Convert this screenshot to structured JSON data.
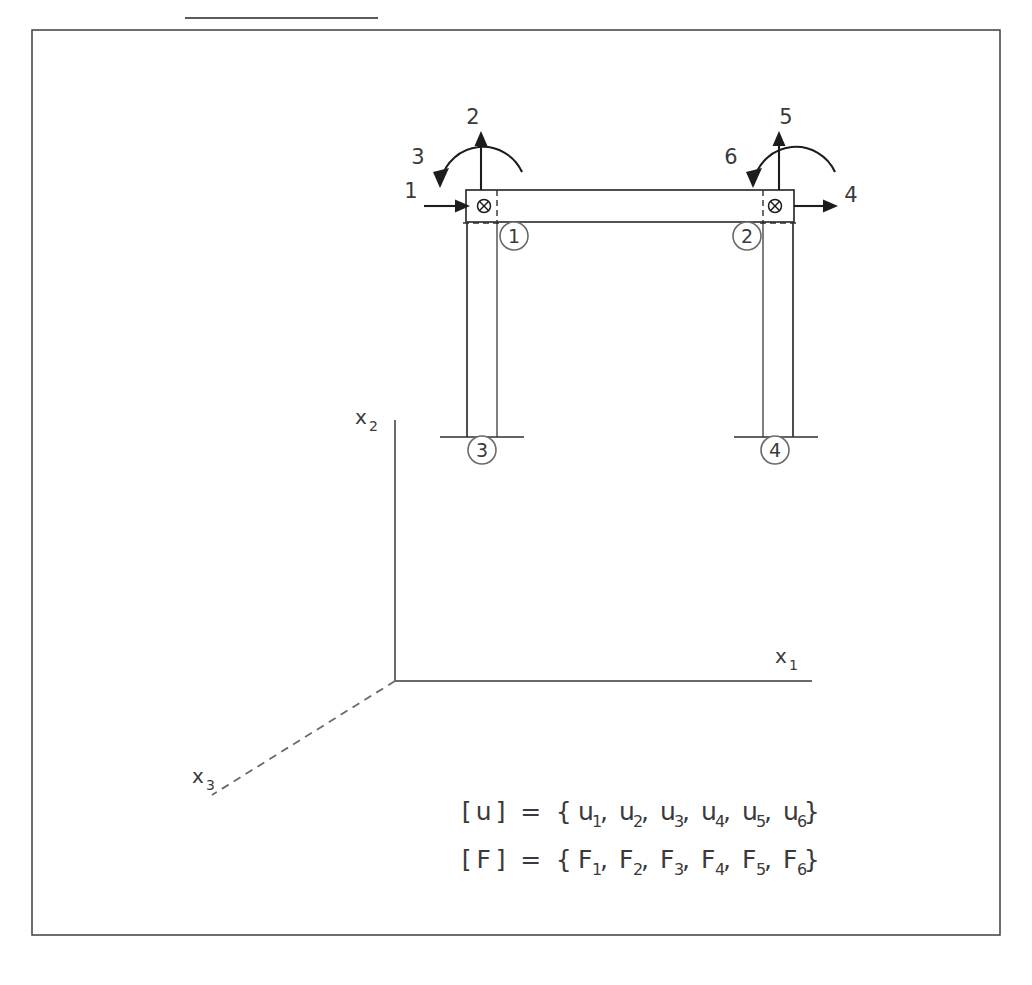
{
  "figure": {
    "top_rule_present": true,
    "border": {
      "x": 32,
      "y": 30,
      "width": 968,
      "height": 905
    }
  },
  "dof_arrows": [
    {
      "id": "dof-1",
      "label": "1",
      "type": "translation",
      "direction": "right",
      "label_x": 411,
      "label_y": 198
    },
    {
      "id": "dof-2",
      "label": "2",
      "type": "translation",
      "direction": "up",
      "label_x": 473,
      "label_y": 124
    },
    {
      "id": "dof-3",
      "label": "3",
      "type": "moment",
      "direction": "counterclockwise",
      "label_x": 418,
      "label_y": 164
    },
    {
      "id": "dof-4",
      "label": "4",
      "type": "translation",
      "direction": "right",
      "label_x": 851,
      "label_y": 202
    },
    {
      "id": "dof-5",
      "label": "5",
      "type": "translation",
      "direction": "up",
      "label_x": 786,
      "label_y": 124
    },
    {
      "id": "dof-6",
      "label": "6",
      "type": "moment",
      "direction": "counterclockwise",
      "label_x": 731,
      "label_y": 164
    }
  ],
  "nodes": [
    {
      "id": "node-1",
      "label": "1",
      "cx": 514,
      "cy": 236,
      "position": "top-left"
    },
    {
      "id": "node-2",
      "label": "2",
      "cx": 747,
      "cy": 236,
      "position": "top-right"
    },
    {
      "id": "node-3",
      "label": "3",
      "cx": 482,
      "cy": 450,
      "position": "bottom-left"
    },
    {
      "id": "node-4",
      "label": "4",
      "cx": 775,
      "cy": 450,
      "position": "bottom-right"
    }
  ],
  "joint_markers": [
    {
      "id": "joint-marker-left",
      "cx": 484,
      "cy": 206,
      "symbol": "circled-x"
    },
    {
      "id": "joint-marker-right",
      "cx": 775,
      "cy": 206,
      "symbol": "circled-x"
    }
  ],
  "axes": [
    {
      "id": "axis-x1",
      "label": "x",
      "subscript": "1",
      "label_x": 781,
      "label_y": 663,
      "style": "solid",
      "orientation": "horizontal"
    },
    {
      "id": "axis-x2",
      "label": "x",
      "subscript": "2",
      "label_x": 362,
      "label_y": 424,
      "style": "solid",
      "orientation": "vertical"
    },
    {
      "id": "axis-x3",
      "label": "x",
      "subscript": "3",
      "label_x": 198,
      "label_y": 783,
      "style": "dashed",
      "orientation": "diagonal"
    }
  ],
  "equations": [
    {
      "id": "equation-displacement",
      "bracket_open": "[",
      "symbol": "u",
      "bracket_close": "]",
      "equals": "=",
      "brace_open": "{",
      "brace_close": "}",
      "terms": [
        {
          "base": "u",
          "sub": "1"
        },
        {
          "base": "u",
          "sub": "2"
        },
        {
          "base": "u",
          "sub": "3"
        },
        {
          "base": "u",
          "sub": "4"
        },
        {
          "base": "u",
          "sub": "5"
        },
        {
          "base": "u",
          "sub": "6"
        }
      ],
      "y": 820
    },
    {
      "id": "equation-force",
      "bracket_open": "[",
      "symbol": "F",
      "bracket_close": "]",
      "equals": "=",
      "brace_open": "{",
      "brace_close": "}",
      "terms": [
        {
          "base": "F",
          "sub": "1"
        },
        {
          "base": "F",
          "sub": "2"
        },
        {
          "base": "F",
          "sub": "3"
        },
        {
          "base": "F",
          "sub": "4"
        },
        {
          "base": "F",
          "sub": "5"
        },
        {
          "base": "F",
          "sub": "6"
        }
      ],
      "y": 868
    }
  ],
  "colors": {
    "line": "#2f2f2f",
    "thin_line": "#555555",
    "arrow": "#1c1c1c",
    "axis": "#6a6a6a",
    "border": "#4a4a4a",
    "background": "#ffffff"
  }
}
